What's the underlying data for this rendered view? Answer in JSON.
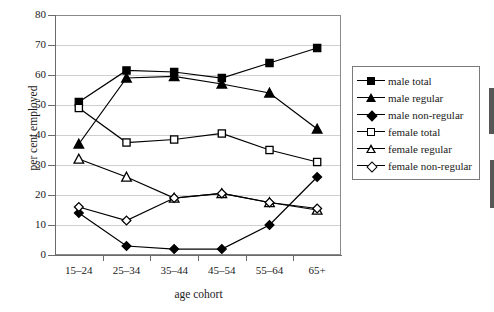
{
  "chart_data": {
    "type": "line",
    "title": "",
    "xlabel": "age cohort",
    "ylabel": "per cent employed",
    "categories": [
      "15–24",
      "25–34",
      "35–44",
      "45–54",
      "55–64",
      "65+"
    ],
    "ylim": [
      0,
      80
    ],
    "yticks": [
      0,
      10,
      20,
      30,
      40,
      50,
      60,
      70,
      80
    ],
    "grid": true,
    "legend_position": "right",
    "series": [
      {
        "name": "male total",
        "marker": "square-filled",
        "values": [
          51,
          61.5,
          61,
          59,
          64,
          69
        ]
      },
      {
        "name": "male regular",
        "marker": "triangle-filled",
        "values": [
          37,
          59,
          59.5,
          57,
          54,
          42
        ]
      },
      {
        "name": "male non-regular",
        "marker": "diamond-filled",
        "values": [
          14,
          3,
          2,
          2,
          10,
          26
        ]
      },
      {
        "name": "female total",
        "marker": "square-open",
        "values": [
          49,
          37.5,
          38.5,
          40.5,
          35,
          31
        ]
      },
      {
        "name": "female regular",
        "marker": "triangle-open",
        "values": [
          32,
          26,
          19,
          20.5,
          17.5,
          15
        ]
      },
      {
        "name": "female non-regular",
        "marker": "diamond-open",
        "values": [
          16,
          11.5,
          19,
          20.5,
          17.5,
          15.5
        ]
      }
    ]
  },
  "axes": {
    "y_title": "per cent employed",
    "x_title": "age cohort",
    "y_tick_labels": [
      "0",
      "10",
      "20",
      "30",
      "40",
      "50",
      "60",
      "70",
      "80"
    ],
    "x_tick_labels": [
      "15–24",
      "25–34",
      "35–44",
      "45–54",
      "55–64",
      "65+"
    ]
  },
  "legend": {
    "items": [
      {
        "label": "male total",
        "marker": "square-filled"
      },
      {
        "label": "male regular",
        "marker": "triangle-filled"
      },
      {
        "label": "male non-regular",
        "marker": "diamond-filled"
      },
      {
        "label": "female total",
        "marker": "square-open"
      },
      {
        "label": "female regular",
        "marker": "triangle-open"
      },
      {
        "label": "female non-regular",
        "marker": "diamond-open"
      }
    ]
  },
  "colors": {
    "series_color": "#000000",
    "gridline": "#cfcfcf",
    "axis": "#6a6a6a",
    "background": "#ffffff"
  }
}
